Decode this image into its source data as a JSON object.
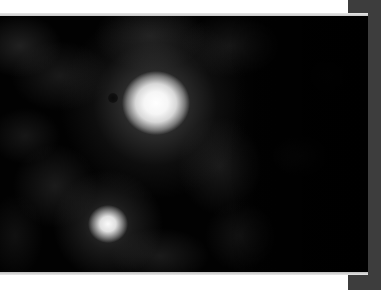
{
  "image": {
    "description": "Grayscale telescope image of two bright galaxy cores in a diffuse cloudy field",
    "subjects": [
      {
        "name": "primary-core",
        "x": 155,
        "y": 103,
        "brightness": "saturated white"
      },
      {
        "name": "secondary-core",
        "x": 108,
        "y": 225,
        "brightness": "bright white"
      },
      {
        "name": "dark-spot",
        "x": 113,
        "y": 98
      }
    ],
    "colors": {
      "background": "#020202",
      "margin": "#ffffff",
      "side_strip": "#3d3d3d"
    }
  }
}
